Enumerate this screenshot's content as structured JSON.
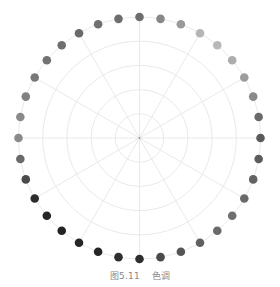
{
  "caption": {
    "figure_number": "图5.11",
    "title": "色调"
  },
  "chart_data": {
    "type": "scatter",
    "coordinate_system": "polar",
    "title": "色调",
    "figure_label": "图5.11",
    "xlabel": "",
    "ylabel": "",
    "grid": true,
    "legend": null,
    "radial_grid_rings": 5,
    "angular_grid_step_deg": 30,
    "angle_start": "top",
    "angle_direction": "clockwise",
    "point_count": 36,
    "radius": 1,
    "angles_deg": [
      0,
      10,
      20,
      30,
      40,
      50,
      60,
      70,
      80,
      90,
      100,
      110,
      120,
      130,
      140,
      150,
      160,
      170,
      180,
      190,
      200,
      210,
      220,
      230,
      240,
      250,
      260,
      270,
      280,
      290,
      300,
      310,
      320,
      330,
      340,
      350
    ],
    "point_colors": [
      "#6e6e6e",
      "#888888",
      "#9a9a9a",
      "#b5b5b5",
      "#b8b8b8",
      "#adadad",
      "#9c9c9c",
      "#8a8a8a",
      "#6a6a6a",
      "#5a5a5a",
      "#5c5c5c",
      "#636363",
      "#6a6a6a",
      "#6e6e6e",
      "#6a6a6a",
      "#606060",
      "#555555",
      "#4a4a4a",
      "#2e2e2e",
      "#2e2e2e",
      "#262626",
      "#262626",
      "#232323",
      "#262626",
      "#2c2c2c",
      "#4a4a4a",
      "#6a6a6a",
      "#8a8a8a",
      "#8a8a8a",
      "#808080",
      "#787878",
      "#727272",
      "#6e6e6e",
      "#6a6a6a",
      "#707070",
      "#6e6e6e"
    ]
  },
  "style": {
    "grid_color": "#e6e6e6",
    "center_color": "#9a9a9a"
  }
}
